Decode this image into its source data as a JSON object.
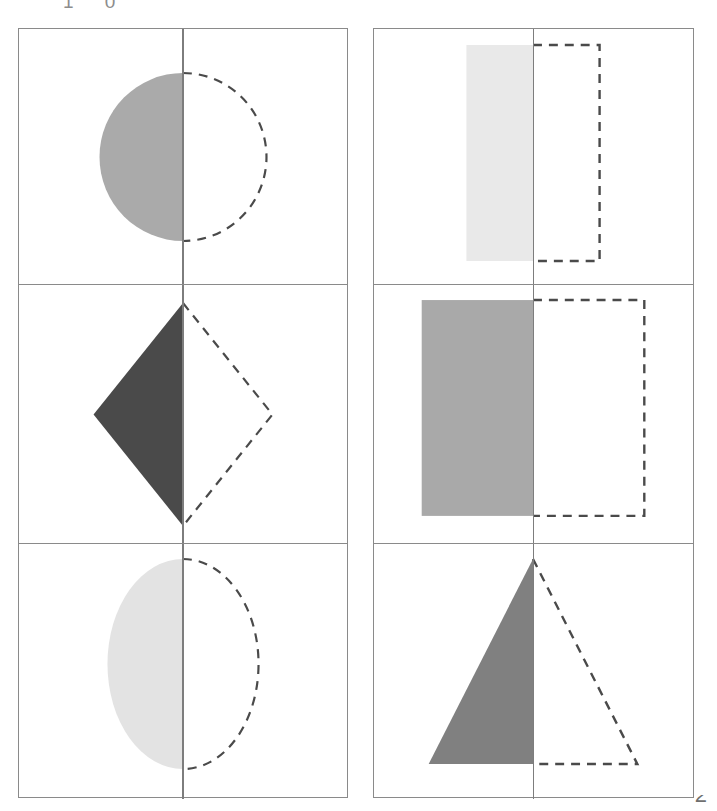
{
  "page": {
    "background_color": "#ffffff",
    "header_fragment_text": "1 0",
    "footer_fragment_text": "2",
    "grid_line_color": "#8a8a8a",
    "mirror_line_color": "#7d7d7d",
    "dash_color": "#4a4a4a",
    "width": 717,
    "height": 811
  },
  "legend": {
    "solid_half_label": "shaded half of shape",
    "dashed_half_label": "dashed reflected half",
    "mirror_label": "line of symmetry"
  },
  "grids": [
    {
      "id": "grid-left",
      "name": "left-column",
      "cells": [
        {
          "index": 0,
          "shape": "circle",
          "shape_label": "Circle",
          "fill": "#aaaaaa",
          "solid_side": "left",
          "dashed_side": "right",
          "geometry": {
            "cx": 165,
            "cy": 128,
            "rx": 84,
            "ry": 84
          }
        },
        {
          "index": 1,
          "shape": "diamond",
          "shape_label": "Diamond",
          "fill": "#4a4a4a",
          "solid_side": "left",
          "dashed_side": "right",
          "geometry": {
            "cx": 165,
            "cy": 148,
            "half_width": 90,
            "half_height": 110
          }
        },
        {
          "index": 2,
          "shape": "ellipse",
          "shape_label": "Ellipse",
          "fill": "#e3e3e3",
          "solid_side": "left",
          "dashed_side": "right",
          "geometry": {
            "cx": 165,
            "cy": 124,
            "rx": 76,
            "ry": 105
          }
        }
      ]
    },
    {
      "id": "grid-right",
      "name": "right-column",
      "cells": [
        {
          "index": 0,
          "shape": "rectangle",
          "shape_label": "Narrow rectangle",
          "fill": "#e9e9e9",
          "solid_side": "left",
          "dashed_side": "right",
          "geometry": {
            "x": 94,
            "y": 16,
            "width": 67,
            "height": 216
          }
        },
        {
          "index": 1,
          "shape": "rectangle",
          "shape_label": "Wide rectangle",
          "fill": "#a9a9a9",
          "solid_side": "left",
          "dashed_side": "right",
          "geometry": {
            "x": 49,
            "y": 15,
            "width": 112,
            "height": 215
          }
        },
        {
          "index": 2,
          "shape": "triangle",
          "shape_label": "Triangle",
          "fill": "#808080",
          "solid_side": "left",
          "dashed_side": "right",
          "geometry": {
            "apex_x": 160,
            "apex_y": 15,
            "base_y": 216,
            "base_left_x": 55
          }
        }
      ]
    }
  ]
}
